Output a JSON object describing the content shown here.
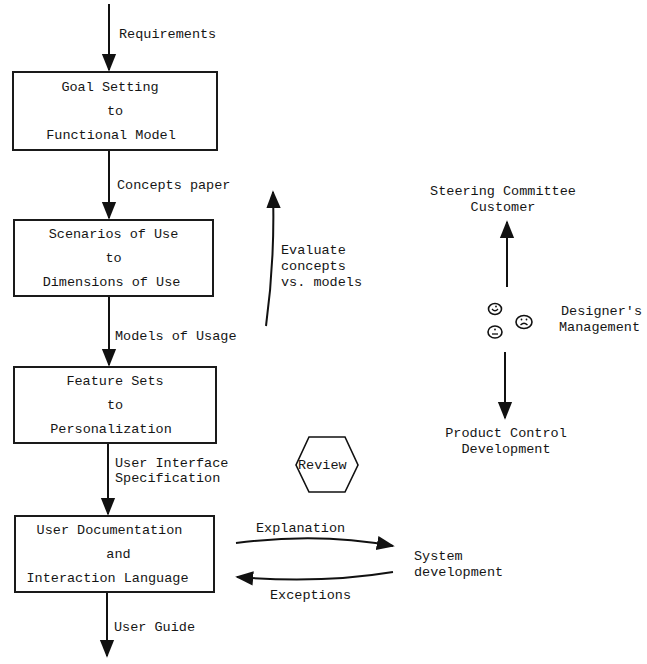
{
  "stages": [
    {
      "lines": [
        "Goal Setting",
        "to",
        "Functional Model"
      ]
    },
    {
      "lines": [
        "Scenarios of Use",
        "to",
        "Dimensions of Use"
      ]
    },
    {
      "lines": [
        "Feature Sets",
        "to",
        "Personalization"
      ]
    },
    {
      "lines": [
        "User Documentation",
        "and",
        "Interaction Language"
      ]
    }
  ],
  "flow_labels": {
    "input": "Requirements",
    "between_1_2": "Concepts paper",
    "between_2_3": "Models of Usage",
    "between_3_4": [
      "User Interface",
      "Specification"
    ],
    "output": "User Guide"
  },
  "feedback": {
    "evaluate": [
      "Evaluate",
      "concepts",
      "vs. models"
    ]
  },
  "review": {
    "label": "Review"
  },
  "stakeholders": {
    "top": [
      "Steering Committee",
      "Customer"
    ],
    "middle": [
      "Designer's",
      "Management"
    ],
    "bottom": [
      "Product Control",
      "Development"
    ],
    "faces": [
      "happy-face",
      "neutral-face",
      "sad-face"
    ]
  },
  "system": {
    "label": [
      "System",
      "development"
    ],
    "to_system": "Explanation",
    "from_system": "Exceptions"
  }
}
